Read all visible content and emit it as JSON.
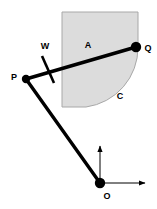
{
  "figure": {
    "canvas": {
      "width": 157,
      "height": 209
    },
    "colors": {
      "background": "#ffffff",
      "stroke": "#000000",
      "region_fill": "#dcdcdc",
      "region_outline": "#9a9a9a"
    },
    "labels": {
      "A": "A",
      "C": "C",
      "W": "W",
      "P": "P",
      "Q": "Q",
      "O": "O"
    },
    "points": [
      {
        "id": "P",
        "label": "P",
        "x": 26,
        "y": 79,
        "marker": "filled-circle",
        "radius": 4
      },
      {
        "id": "Q",
        "label": "Q",
        "x": 136,
        "y": 47,
        "marker": "filled-circle",
        "radius": 5
      },
      {
        "id": "O",
        "label": "O",
        "x": 100,
        "y": 183,
        "marker": "filled-circle",
        "radius": 5
      }
    ],
    "links": [
      {
        "id": "PQ",
        "from": "P",
        "to": "Q",
        "style": "thick-solid"
      },
      {
        "id": "PO",
        "from": "P",
        "to": "O",
        "style": "thick-solid"
      }
    ],
    "tick": {
      "id": "W",
      "label": "W",
      "x": 48,
      "y": 68,
      "style": "thick-cross-stroke"
    },
    "region": {
      "id": "A",
      "label": "A",
      "rect": {
        "x": 62,
        "y": 12,
        "width": 76,
        "height": 95
      },
      "arc_label": "C",
      "fill": "#dcdcdc"
    },
    "axes": [
      {
        "id": "y-axis",
        "from": "O",
        "direction": "up",
        "length": 43,
        "style": "thin-arrow"
      },
      {
        "id": "x-axis",
        "from": "O",
        "direction": "right",
        "length": 52,
        "style": "thin-arrow"
      }
    ]
  }
}
